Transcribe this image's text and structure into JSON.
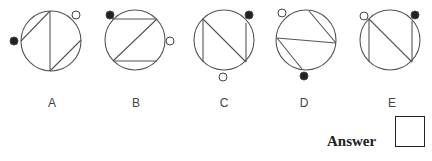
{
  "figure": {
    "options": [
      {
        "label": "A",
        "circle": {
          "cx": 51,
          "cy": 41,
          "r": 30
        },
        "lines": [
          [
            50,
            11,
            50,
            71
          ],
          [
            21,
            41,
            50,
            11
          ],
          [
            50,
            71,
            81,
            40
          ]
        ],
        "dots": [
          {
            "type": "black",
            "cx": 14,
            "cy": 41
          },
          {
            "type": "white",
            "cx": 76,
            "cy": 15
          }
        ]
      },
      {
        "label": "B",
        "circle": {
          "cx": 135,
          "cy": 40,
          "r": 30
        },
        "lines": [
          [
            112,
            19,
            157,
            19
          ],
          [
            157,
            19,
            113,
            61
          ],
          [
            113,
            61,
            157,
            61
          ]
        ],
        "dots": [
          {
            "type": "black",
            "cx": 110,
            "cy": 15
          },
          {
            "type": "white",
            "cx": 170,
            "cy": 41
          }
        ]
      },
      {
        "label": "C",
        "circle": {
          "cx": 224,
          "cy": 40,
          "r": 30
        },
        "lines": [
          [
            203,
            19,
            203,
            62
          ],
          [
            203,
            19,
            246,
            62
          ],
          [
            246,
            23,
            246,
            62
          ]
        ],
        "dots": [
          {
            "type": "black",
            "cx": 249,
            "cy": 15
          },
          {
            "type": "white",
            "cx": 223,
            "cy": 77
          }
        ]
      },
      {
        "label": "D",
        "circle": {
          "cx": 306,
          "cy": 40,
          "r": 30
        },
        "lines": [
          [
            309,
            11,
            336,
            43
          ],
          [
            277,
            38,
            336,
            43
          ],
          [
            277,
            38,
            302,
            69
          ]
        ],
        "dots": [
          {
            "type": "white",
            "cx": 282,
            "cy": 13
          },
          {
            "type": "black",
            "cx": 304,
            "cy": 76
          }
        ]
      },
      {
        "label": "E",
        "circle": {
          "cx": 390,
          "cy": 40,
          "r": 30
        },
        "lines": [
          [
            369,
            19,
            369,
            62
          ],
          [
            369,
            19,
            412,
            62
          ],
          [
            412,
            21,
            412,
            62
          ]
        ],
        "dots": [
          {
            "type": "white",
            "cx": 364,
            "cy": 16
          },
          {
            "type": "black",
            "cx": 415,
            "cy": 15
          }
        ]
      }
    ],
    "label_positions": [
      52,
      136,
      224,
      304,
      392
    ]
  },
  "answer": {
    "label": "Answer"
  }
}
